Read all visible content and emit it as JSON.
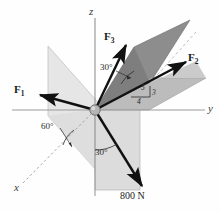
{
  "figure": {
    "background": "#fefefe"
  },
  "axes": [
    {
      "name": "z-axis",
      "label": "z",
      "orientation": "vertical-up"
    },
    {
      "name": "y-axis",
      "label": "y",
      "orientation": "horizontal-right"
    },
    {
      "name": "x-axis",
      "label": "x",
      "orientation": "diagonal-lower-left-dashed"
    }
  ],
  "forces": [
    {
      "name": "F1",
      "label": "F",
      "subscript": "1",
      "direction": "upper-left"
    },
    {
      "name": "F2",
      "label": "F",
      "subscript": "2",
      "direction": "upper-right"
    },
    {
      "name": "F3",
      "label": "F",
      "subscript": "3",
      "direction": "upper-left-of-z"
    },
    {
      "name": "F800",
      "label": "800 N",
      "direction": "lower-right"
    }
  ],
  "angles": [
    {
      "name": "angle-f3",
      "value": "30°"
    },
    {
      "name": "angle-x-plane",
      "value": "60°"
    },
    {
      "name": "angle-800n",
      "value": "30°"
    }
  ],
  "slope_triangle": {
    "name": "3-4-5-triangle",
    "hypotenuse": "5",
    "vertical": "3",
    "horizontal": "4"
  },
  "colors": {
    "plane_light": "#e3e3e3",
    "plane_medium": "#c2c2c2",
    "plane_dark": "#8f8f8f",
    "axis": "#9a9a9a",
    "vector": "#111111",
    "text": "#1a1a1a"
  }
}
